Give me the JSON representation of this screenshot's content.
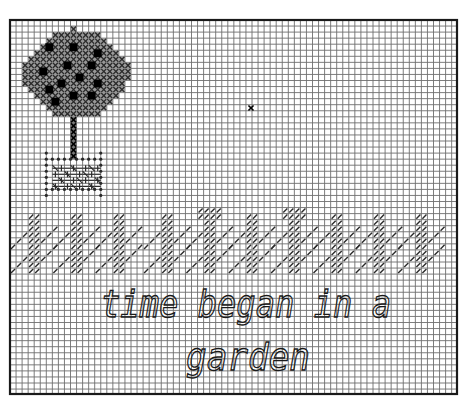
{
  "pattern": {
    "title_text_line1": "time began in a",
    "title_text_line2": "garden",
    "grid": {
      "left": 10,
      "top": 20,
      "right": 457,
      "bottom": 394,
      "cell": 6.05,
      "line_color": "#6e6e6e",
      "border_color": "#1a1a1a",
      "background": "#ffffff"
    },
    "colors": {
      "stitch": "#2a2a2a",
      "stitch_light": "#555555",
      "fruit": "#000000",
      "text": "#1a1a1a"
    },
    "tree": {
      "canopy_center": [
        76,
        74
      ],
      "canopy_radius_x": 53,
      "canopy_radius_y": 45,
      "fruits": [
        [
          50,
          48
        ],
        [
          74,
          47
        ],
        [
          99,
          53
        ],
        [
          43,
          72
        ],
        [
          68,
          66
        ],
        [
          93,
          66
        ],
        [
          80,
          78
        ],
        [
          62,
          84
        ],
        [
          100,
          83
        ],
        [
          49,
          92
        ],
        [
          75,
          95
        ],
        [
          93,
          95
        ],
        [
          56,
          101
        ]
      ],
      "trunk": {
        "x": 74,
        "y_top": 118,
        "y_bottom": 154
      },
      "pot": {
        "x0": 49,
        "y0": 154,
        "x1": 104,
        "y1": 196
      }
    },
    "stray_stitch": [
      251,
      108
    ],
    "grass": {
      "y_top": 210,
      "y_bottom": 276,
      "clumps_x": [
        30,
        75,
        118,
        162,
        206,
        250,
        292,
        336,
        378,
        420
      ],
      "tall_clumps": [
        4,
        6
      ]
    }
  }
}
